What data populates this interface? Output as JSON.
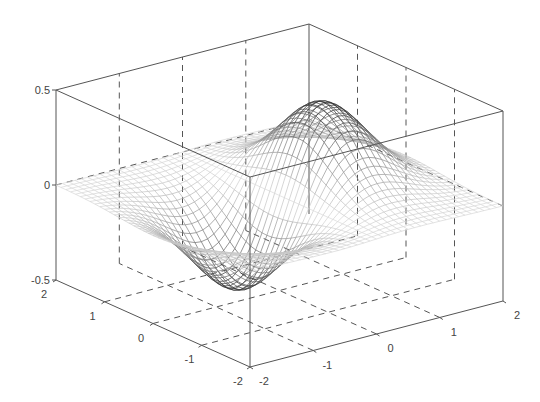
{
  "chart_data": {
    "type": "surface-mesh",
    "title": "",
    "xlabel": "",
    "ylabel": "",
    "zlabel": "",
    "function": "z = x * exp(-x^2 - y^2)",
    "x_range": [
      -2,
      2
    ],
    "y_range": [
      -2,
      2
    ],
    "zlim": [
      -0.5,
      0.5
    ],
    "grid": true,
    "mesh_steps": 40,
    "x_ticks": [
      -2,
      -1,
      0,
      1,
      2
    ],
    "y_ticks": [
      -2,
      -1,
      0,
      1,
      2
    ],
    "z_ticks": [
      -0.5,
      0,
      0.5
    ],
    "x_tick_labels": [
      "-2",
      "-1",
      "0",
      "1",
      "2"
    ],
    "y_tick_labels": [
      "-2",
      "-1",
      "0",
      "1",
      "2"
    ],
    "z_tick_labels": [
      "-0.5",
      "0",
      "0.5"
    ],
    "extrema": {
      "max": {
        "x": 0.707,
        "y": 0,
        "z": 0.429
      },
      "min": {
        "x": -0.707,
        "y": 0,
        "z": -0.429
      }
    },
    "projection": {
      "origin_px": [
        250,
        367
      ],
      "x_dir_px_per_4units": [
        253,
        -66
      ],
      "y_dir_px_per_4units": [
        -194,
        -87
      ],
      "z_px_per_unit": 190
    },
    "colors": {
      "axes": "#555555",
      "labels": "#444444",
      "mesh_dark": "#2a2a2a",
      "mesh_light": "#d8d8d8"
    }
  }
}
